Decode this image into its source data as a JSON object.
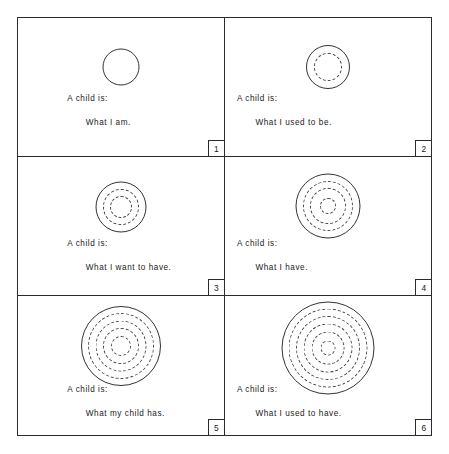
{
  "figure": {
    "line_color": "#333333",
    "border_color": "#2b2b2b",
    "background": "#ffffff",
    "lead_text": "A child is:",
    "panels": [
      {
        "number": "1",
        "lead": "A child is:",
        "answer": "What I am.",
        "outer_diameter": 37,
        "solid_rings": 1,
        "dashed_rings": 0,
        "ring_diameters": [
          37
        ]
      },
      {
        "number": "2",
        "lead": "A child is:",
        "answer": "What I used to be.",
        "outer_diameter": 44,
        "solid_rings": 1,
        "dashed_rings": 1,
        "ring_diameters": [
          44,
          28
        ]
      },
      {
        "number": "3",
        "lead": "A child is:",
        "answer": "What I want to have.",
        "outer_diameter": 51,
        "solid_rings": 1,
        "dashed_rings": 2,
        "ring_diameters": [
          51,
          36,
          22
        ]
      },
      {
        "number": "4",
        "lead": "A child is:",
        "answer": "What I have.",
        "outer_diameter": 65,
        "solid_rings": 1,
        "dashed_rings": 3,
        "ring_diameters": [
          65,
          50,
          36,
          16
        ]
      },
      {
        "number": "5",
        "lead": "A child is:",
        "answer": "What my child has.",
        "outer_diameter": 80,
        "solid_rings": 1,
        "dashed_rings": 4,
        "ring_diameters": [
          80,
          66,
          51,
          36,
          20
        ]
      },
      {
        "number": "6",
        "lead": "A child is:",
        "answer": "What I used to have.",
        "outer_diameter": 93,
        "solid_rings": 1,
        "dashed_rings": 5,
        "ring_diameters": [
          93,
          79,
          64,
          49,
          33,
          15
        ]
      }
    ]
  }
}
